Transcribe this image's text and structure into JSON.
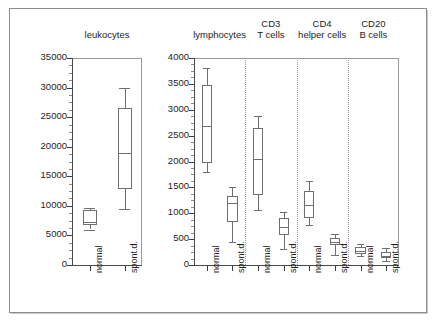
{
  "figure": {
    "background": "#ffffff",
    "frame_color": "#8d8d8d",
    "line_color": "#6f6f6f"
  },
  "chart_data": {
    "type": "box",
    "title": "",
    "subtitle": "",
    "xlabel": "",
    "ylabel": "",
    "grid": false,
    "legend_position": "none",
    "panels": [
      {
        "id": "leukocytes",
        "title": "leukocytes",
        "ylim": [
          0,
          35000
        ],
        "yticks": [
          0,
          5000,
          10000,
          15000,
          20000,
          25000,
          30000,
          35000
        ],
        "ytick_labels": [
          "0",
          "5000",
          "10000",
          "15000",
          "20000",
          "25000",
          "30000",
          "35000"
        ],
        "minor_tick_step": 1250,
        "groups": [
          {
            "label": "normal",
            "whisker_low": 6000,
            "q1": 6700,
            "median": 7200,
            "q3": 9300,
            "whisker_high": 9700
          },
          {
            "label": "spont.d.",
            "whisker_low": 9500,
            "q1": 12900,
            "median": 19000,
            "q3": 26600,
            "whisker_high": 29900
          }
        ]
      },
      {
        "id": "subsets",
        "title": "",
        "ylim": [
          0,
          4000
        ],
        "yticks": [
          0,
          500,
          1000,
          1500,
          2000,
          2500,
          3000,
          3500,
          4000
        ],
        "ytick_labels": [
          "0",
          "500",
          "1000",
          "1500",
          "2000",
          "2500",
          "3000",
          "3500",
          "4000"
        ],
        "minor_tick_step": 125,
        "sections": [
          {
            "title": "lymphocytes",
            "title_lines": [
              "",
              "lymphocytes"
            ],
            "groups": [
              {
                "label": "normal",
                "whisker_low": 1800,
                "q1": 1980,
                "median": 2680,
                "q3": 3470,
                "whisker_high": 3800
              },
              {
                "label": "spont.d.",
                "whisker_low": 450,
                "q1": 830,
                "median": 1200,
                "q3": 1330,
                "whisker_high": 1500
              }
            ]
          },
          {
            "title": "CD3 T cells",
            "title_lines": [
              "CD3",
              "T cells"
            ],
            "groups": [
              {
                "label": "normal",
                "whisker_low": 1060,
                "q1": 1350,
                "median": 2050,
                "q3": 2640,
                "whisker_high": 2870
              },
              {
                "label": "spont.d.",
                "whisker_low": 300,
                "q1": 580,
                "median": 730,
                "q3": 900,
                "whisker_high": 1030
              }
            ]
          },
          {
            "title": "CD4 helper cells",
            "title_lines": [
              "CD4",
              "helper cells"
            ],
            "groups": [
              {
                "label": "normal",
                "whisker_low": 780,
                "q1": 900,
                "median": 1150,
                "q3": 1430,
                "whisker_high": 1620
              },
              {
                "label": "spont.d.",
                "whisker_low": 200,
                "q1": 390,
                "median": 450,
                "q3": 520,
                "whisker_high": 600
              }
            ]
          },
          {
            "title": "CD20 B cells",
            "title_lines": [
              "CD20",
              "B cells"
            ],
            "groups": [
              {
                "label": "normal",
                "whisker_low": 180,
                "q1": 220,
                "median": 280,
                "q3": 350,
                "whisker_high": 400
              },
              {
                "label": "spont.d.",
                "whisker_low": 80,
                "q1": 140,
                "median": 180,
                "q3": 250,
                "whisker_high": 330
              }
            ]
          }
        ]
      }
    ]
  }
}
